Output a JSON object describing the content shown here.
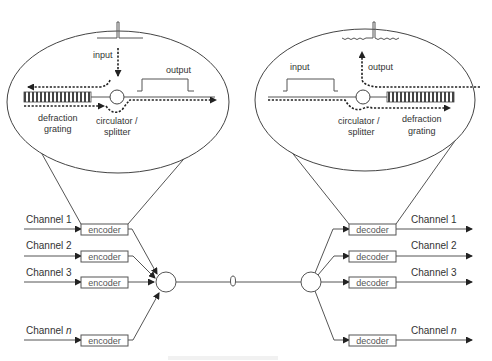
{
  "encoder_side": {
    "zoom": {
      "input_label": "input",
      "output_label": "output",
      "grating_label_1": "defraction",
      "grating_label_2": "grating",
      "circulator_label_1": "circulator /",
      "circulator_label_2": "splitter"
    },
    "channels": [
      {
        "label": "Channel 1",
        "box": "encoder"
      },
      {
        "label": "Channel 2",
        "box": "encoder"
      },
      {
        "label": "Channel 3",
        "box": "encoder"
      },
      {
        "label": "Channel ",
        "label_italic": "n",
        "box": "encoder"
      }
    ]
  },
  "decoder_side": {
    "zoom": {
      "input_label": "input",
      "output_label": "output",
      "grating_label_1": "defraction",
      "grating_label_2": "grating",
      "circulator_label_1": "circulator /",
      "circulator_label_2": "splitter"
    },
    "channels": [
      {
        "label": "Channel 1",
        "box": "decoder"
      },
      {
        "label": "Channel 2",
        "box": "decoder"
      },
      {
        "label": "Channel 3",
        "box": "decoder"
      },
      {
        "label": "Channel ",
        "label_italic": "n",
        "box": "decoder"
      }
    ]
  },
  "link": {
    "fiber_coil_icon": "fiber-coil-icon"
  }
}
